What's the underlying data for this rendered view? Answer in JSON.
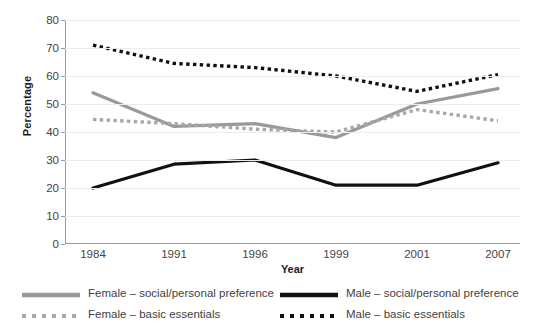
{
  "chart_data": {
    "type": "line",
    "title": "",
    "xlabel": "Year",
    "ylabel": "Percentage",
    "categories": [
      "1984",
      "1991",
      "1996",
      "1999",
      "2001",
      "2007"
    ],
    "ylim": [
      0,
      80
    ],
    "yticks": [
      0,
      10,
      20,
      30,
      40,
      50,
      60,
      70,
      80
    ],
    "grid": true,
    "legend_position": "bottom",
    "series": [
      {
        "name": "Female – social/personal preference",
        "values": [
          54,
          42,
          43,
          38,
          50,
          55.5
        ],
        "color": "#999999",
        "style": "solid"
      },
      {
        "name": "Female – basic essentials",
        "values": [
          44.5,
          43,
          41,
          40,
          48,
          44
        ],
        "color": "#a8a8a8",
        "style": "dotted"
      },
      {
        "name": "Male – social/personal preference",
        "values": [
          20,
          28.5,
          30,
          21,
          21,
          29
        ],
        "color": "#111111",
        "style": "solid"
      },
      {
        "name": "Male – basic essentials",
        "values": [
          71,
          64.5,
          63,
          60,
          54.5,
          60.5
        ],
        "color": "#111111",
        "style": "dotted"
      }
    ]
  },
  "legend": {
    "items": [
      {
        "label": "Female – social/personal preference"
      },
      {
        "label": "Male – social/personal preference"
      },
      {
        "label": "Female – basic essentials"
      },
      {
        "label": "Male – basic essentials"
      }
    ]
  },
  "colors": {
    "female": "#999999",
    "male": "#111111",
    "grid": "#ececec",
    "axis": "#9a9a9a"
  }
}
